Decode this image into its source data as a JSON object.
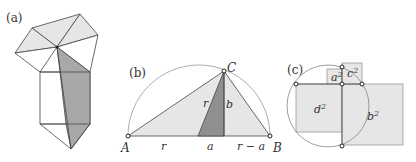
{
  "colors": {
    "light_fill": "#e6e6e6",
    "dark_fill": "#9a9a9a",
    "medium_fill": "#b0b0b0",
    "stroke": "#444444",
    "circle_stroke": "#888888"
  },
  "panel_a": {
    "label": "(a)"
  },
  "panel_b": {
    "label": "(b)",
    "points": {
      "A": "A",
      "B": "B",
      "C": "C"
    },
    "segment_labels": {
      "r_left": "r",
      "r_slant": "r",
      "b": "b",
      "a": "a",
      "r_minus_a": "r − a"
    }
  },
  "panel_c": {
    "label": "(c)",
    "squares": {
      "a": "a",
      "c": "c",
      "d": "d",
      "b": "b"
    },
    "exponent": "2"
  }
}
